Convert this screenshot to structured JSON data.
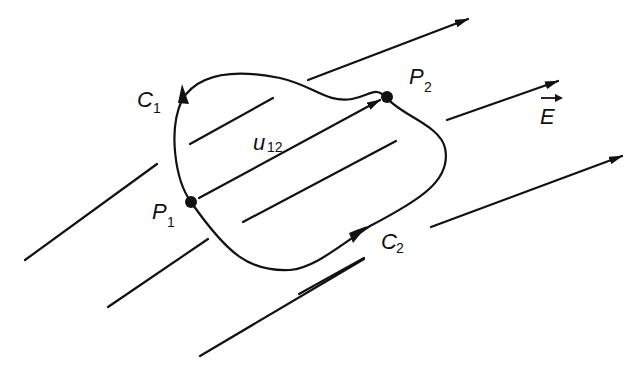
{
  "diagram": {
    "labels": {
      "c1_main": "C",
      "c1_sub": "1",
      "c2_main": "C",
      "c2_sub": "2",
      "p1_main": "P",
      "p1_sub": "1",
      "p2_main": "P",
      "p2_sub": "2",
      "u12_main": "u",
      "u12_sub": "12",
      "field": "E"
    },
    "colors": {
      "stroke": "#111111",
      "background": "#ffffff"
    }
  }
}
